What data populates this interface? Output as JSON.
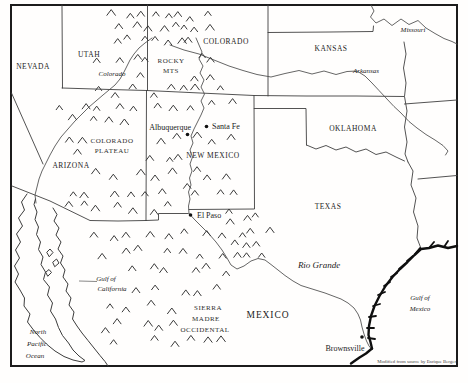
{
  "states": [
    {
      "name": "NEVADA"
    },
    {
      "name": "UTAH"
    },
    {
      "name": "COLORADO"
    },
    {
      "name": "KANSAS"
    },
    {
      "name": "OKLAHOMA"
    },
    {
      "name": "NEW MEXICO"
    },
    {
      "name": "ARIZONA"
    },
    {
      "name": "TEXAS"
    },
    {
      "name": "MEXICO"
    }
  ],
  "regions": {
    "rocky": [
      "ROCKY",
      "MTS"
    ],
    "plateau": [
      "COLORADO",
      "PLATEAU"
    ],
    "sierra": [
      "SIERRA",
      "MADRE",
      "OCCIDENTAL"
    ]
  },
  "rivers": {
    "colorado": "Colorado",
    "arkansas": "Arkansas",
    "missouri": "Missouri",
    "rio_grande": "Rio Grande"
  },
  "waters": {
    "gulf_california": [
      "Gulf of",
      "California"
    ],
    "gulf_mexico": [
      "Gulf of",
      "Mexico"
    ],
    "pacific": [
      "North",
      "Pacific",
      "Ocean"
    ]
  },
  "cities": [
    {
      "name": "Albuquerque"
    },
    {
      "name": "Santa Fe"
    },
    {
      "name": "El Paso"
    },
    {
      "name": "Brownsville"
    }
  ],
  "credit": "Modified from source by Enrique Berger",
  "colors": {
    "ink": "#222222",
    "line": "#404040",
    "coast": "#0f0f0f",
    "paper": "#fffefd"
  },
  "mountain_clusters": [
    {
      "x": 112,
      "y": 10,
      "w": 104,
      "h": 40,
      "n": 26
    },
    {
      "x": 96,
      "y": 52,
      "w": 122,
      "h": 40,
      "n": 18
    },
    {
      "x": 58,
      "y": 96,
      "w": 180,
      "h": 118,
      "n": 64
    },
    {
      "x": 226,
      "y": 212,
      "w": 42,
      "h": 52,
      "n": 11
    },
    {
      "x": 88,
      "y": 226,
      "w": 148,
      "h": 118,
      "n": 48,
      "coast_clip": true
    }
  ]
}
